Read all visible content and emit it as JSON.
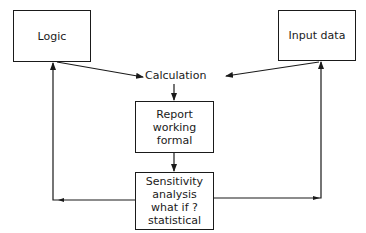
{
  "diagram": {
    "type": "flowchart",
    "nodes": {
      "logic": {
        "label": "Logic"
      },
      "input_data": {
        "label": "Input data"
      },
      "calculation": {
        "label": "Calculation"
      },
      "report": {
        "lines": [
          "Report",
          "working",
          "formal"
        ]
      },
      "sensitivity": {
        "lines": [
          "Sensitivity",
          "analysis",
          "what if ?",
          "statistical"
        ]
      }
    },
    "edges": [
      {
        "from": "Logic",
        "to": "Calculation"
      },
      {
        "from": "Input data",
        "to": "Calculation"
      },
      {
        "from": "Calculation",
        "to": "Report working formal"
      },
      {
        "from": "Report working formal",
        "to": "Sensitivity analysis"
      },
      {
        "from": "Sensitivity analysis",
        "to": "Logic"
      },
      {
        "from": "Sensitivity analysis",
        "to": "Input data"
      }
    ],
    "colors": {
      "stroke": "#1a1a1a",
      "background": "#ffffff"
    }
  }
}
